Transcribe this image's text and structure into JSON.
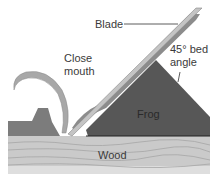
{
  "diagram": {
    "type": "cross-section illustration",
    "labels": {
      "blade": "Blade",
      "close_mouth_line1": "Close",
      "close_mouth_line2": "mouth",
      "bed_angle_line1": "45° bed",
      "bed_angle_line2": "angle",
      "frog": "Frog",
      "wood": "Wood"
    },
    "colors": {
      "wood": "#c8c8c8",
      "wood_grain": "#a8a8a8",
      "frog": "#5a5a5a",
      "sole": "#7a7a7a",
      "blade": "#b0b0b0",
      "shaving": "#a0a0a0",
      "text": "#3a3a3a"
    }
  }
}
